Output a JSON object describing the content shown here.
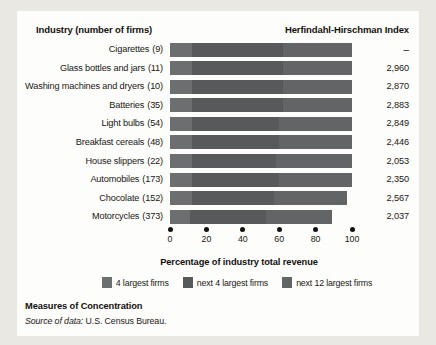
{
  "figure": {
    "header_left": "Industry (number of firms)",
    "header_right": "Herfindahl-Hirschman Index",
    "caption_title": "Measures of Concentration",
    "source_label": "Source of data:",
    "source_value": "U.S. Census Bureau."
  },
  "chart_data": {
    "type": "bar",
    "orientation": "horizontal",
    "stacked": true,
    "title": "Measures of Concentration",
    "xlabel": "Percentage of industry total revenue",
    "ylabel": "Industry (number of firms)",
    "xlim": [
      0,
      100
    ],
    "xticks": [
      0,
      20,
      40,
      60,
      80,
      100
    ],
    "xticklabels": [
      "0",
      "20",
      "40",
      "60",
      "80",
      "100"
    ],
    "grid": false,
    "legend_position": "bottom",
    "legend": [
      {
        "name": "4 largest firms",
        "color": "#6d6e70"
      },
      {
        "name": "next 4 largest firms",
        "color": "#58595b"
      },
      {
        "name": "next 12 largest firms",
        "color": "#636466"
      }
    ],
    "categories": [
      "Cigarettes",
      "Glass bottles and jars",
      "Washing machines and dryers",
      "Batteries",
      "Light bulbs",
      "Breakfast cereals",
      "House slippers",
      "Automobiles",
      "Chocolate",
      "Motorcycles"
    ],
    "firms": [
      9,
      11,
      10,
      35,
      54,
      48,
      22,
      173,
      152,
      373
    ],
    "firms_labels": [
      "(9)",
      "(11)",
      "(10)",
      "(35)",
      "(54)",
      "(48)",
      "(22)",
      "(173)",
      "(152)",
      "(373)"
    ],
    "hhi": [
      "–",
      "2,960",
      "2,870",
      "2,883",
      "2,849",
      "2,446",
      "2,053",
      "2,350",
      "2,567",
      "2,037"
    ],
    "series": [
      {
        "name": "4 largest firms",
        "values": [
          95,
          92,
          93,
          90,
          89,
          83,
          77,
          82,
          75,
          69
        ]
      },
      {
        "name": "next 4 largest firms",
        "values": [
          5,
          7,
          6,
          8,
          8,
          11,
          13,
          11,
          14,
          13
        ]
      },
      {
        "name": "next 12 largest firms",
        "values": [
          0,
          1,
          1,
          2,
          3,
          6,
          10,
          7,
          8,
          7
        ]
      }
    ],
    "totals": [
      100,
      100,
      100,
      100,
      100,
      100,
      100,
      100,
      97,
      89
    ],
    "rows": [
      {
        "label": "Cigarettes",
        "firms": "(9)",
        "hhi": "–",
        "segments": [
          12,
          50,
          38
        ]
      },
      {
        "label": "Glass bottles and jars",
        "firms": "(11)",
        "hhi": "2,960",
        "segments": [
          12,
          50,
          38
        ]
      },
      {
        "label": "Washing machines and dryers",
        "firms": "(10)",
        "hhi": "2,870",
        "segments": [
          12,
          50,
          38
        ]
      },
      {
        "label": "Batteries",
        "firms": "(35)",
        "hhi": "2,883",
        "segments": [
          12,
          50,
          38
        ]
      },
      {
        "label": "Light bulbs",
        "firms": "(54)",
        "hhi": "2,849",
        "segments": [
          12,
          48,
          40
        ]
      },
      {
        "label": "Breakfast cereals",
        "firms": "(48)",
        "hhi": "2,446",
        "segments": [
          12,
          48,
          40
        ]
      },
      {
        "label": "House slippers",
        "firms": "(22)",
        "hhi": "2,053",
        "segments": [
          12,
          46,
          42
        ]
      },
      {
        "label": "Automobiles",
        "firms": "(173)",
        "hhi": "2,350",
        "segments": [
          12,
          48,
          40
        ]
      },
      {
        "label": "Chocolate",
        "firms": "(152)",
        "hhi": "2,567",
        "segments": [
          12,
          45,
          40
        ]
      },
      {
        "label": "Motorcycles",
        "firms": "(373)",
        "hhi": "2,037",
        "segments": [
          11,
          42,
          36
        ]
      }
    ]
  }
}
